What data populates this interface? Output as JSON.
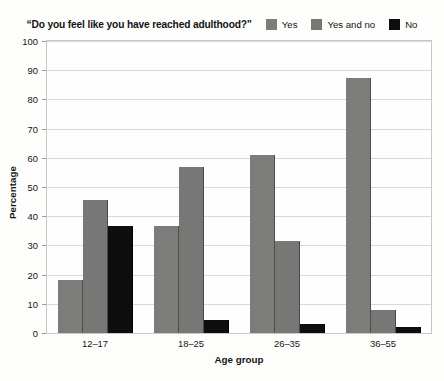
{
  "chart_data": {
    "type": "bar",
    "title": "“Do you feel like you have reached adulthood?”",
    "xlabel": "Age group",
    "ylabel": "Percentage",
    "categories": [
      "12–17",
      "18–25",
      "26–35",
      "36–55"
    ],
    "series": [
      {
        "name": "Yes",
        "color": "#7c7c7a",
        "values": [
          18,
          36.5,
          61,
          87.5
        ]
      },
      {
        "name": "Yes and no",
        "color": "#777775",
        "values": [
          45.5,
          57,
          31.5,
          8
        ]
      },
      {
        "name": "No",
        "color": "#0d0d0d",
        "values": [
          36.5,
          4.5,
          3,
          2
        ]
      }
    ],
    "ylim": [
      0,
      100
    ],
    "yticks": [
      0,
      10,
      20,
      30,
      40,
      50,
      60,
      70,
      80,
      90,
      100
    ],
    "grid": true,
    "legend_position": "top"
  }
}
